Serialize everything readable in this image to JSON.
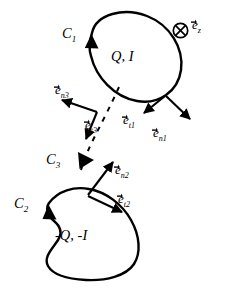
{
  "figure": {
    "type": "physics-diagram",
    "stroke_color": "#000000",
    "background_color": "#ffffff"
  },
  "labels": {
    "c1": "C",
    "c1_sub": "1",
    "c2": "C",
    "c2_sub": "2",
    "c3": "C",
    "c3_sub": "3",
    "loop1_charge": "Q, I",
    "loop2_charge": "-Q, -I",
    "ez": "e",
    "ez_sub": "z",
    "et1": "e",
    "et1_sub": "t1",
    "en1": "e",
    "en1_sub": "n1",
    "et2": "e",
    "et2_sub": "t2",
    "en2": "e",
    "en2_sub": "n2",
    "et3": "e",
    "et3_sub": "t3",
    "en3": "e",
    "en3_sub": "n3",
    "into_page_symbol": "into-page-cross-circle"
  }
}
